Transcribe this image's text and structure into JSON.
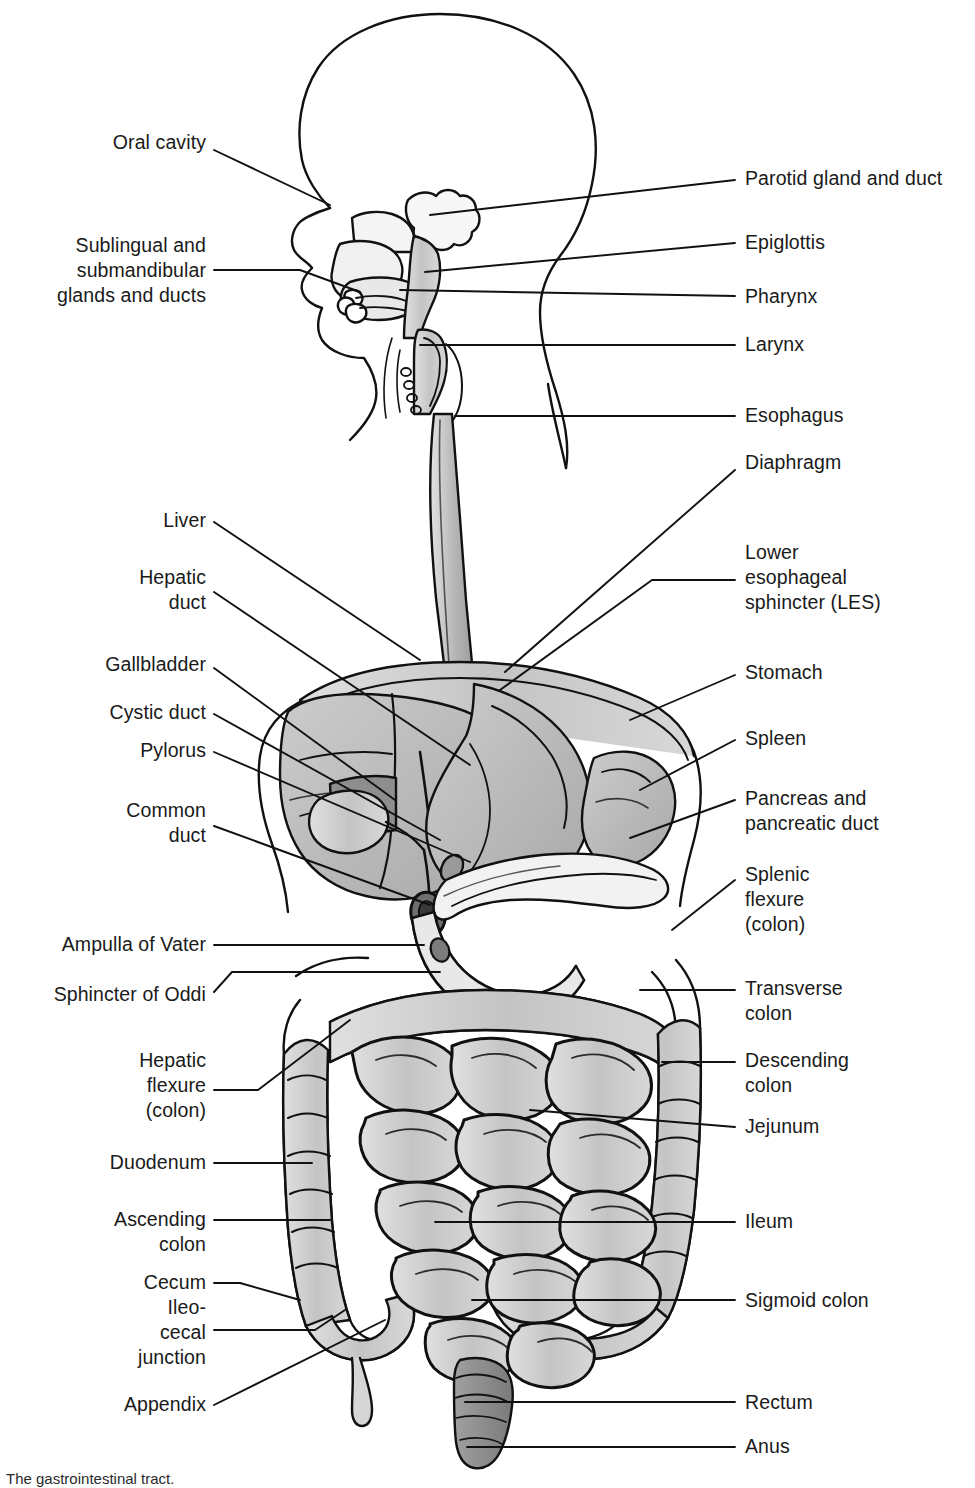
{
  "figure": {
    "title": "The gastrointestinal tract",
    "caption": "The gastrointestinal tract.",
    "type": "anatomical-diagram",
    "view": "sagittal / anterior composite",
    "colors": {
      "ink": "#1a1a1a",
      "background": "#ffffff",
      "fill_light": "#d0d0d0",
      "fill_mid": "#b4b4b4",
      "fill_dark": "#8e8e8e",
      "fill_deep": "#6f6f6f"
    }
  },
  "labels_left": [
    {
      "id": "oral-cavity",
      "text": "Oral cavity",
      "x": 8,
      "y": 130,
      "w": 198,
      "line": [
        [
          214,
          150
        ],
        [
          330,
          205
        ]
      ]
    },
    {
      "id": "sublingual",
      "text": "Sublingual and\nsubmandibular\nglands and ducts",
      "x": 8,
      "y": 233,
      "w": 198,
      "line": [
        [
          214,
          270
        ],
        [
          300,
          270
        ],
        [
          360,
          292
        ]
      ]
    },
    {
      "id": "liver",
      "text": "Liver",
      "x": 8,
      "y": 508,
      "w": 198,
      "line": [
        [
          214,
          522
        ],
        [
          420,
          660
        ]
      ]
    },
    {
      "id": "hepatic-duct",
      "text": "Hepatic\nduct",
      "x": 8,
      "y": 565,
      "w": 198,
      "line": [
        [
          214,
          592
        ],
        [
          470,
          765
        ]
      ]
    },
    {
      "id": "gallbladder",
      "text": "Gallbladder",
      "x": 8,
      "y": 652,
      "w": 198,
      "line": [
        [
          214,
          668
        ],
        [
          395,
          800
        ]
      ]
    },
    {
      "id": "cystic-duct",
      "text": "Cystic duct",
      "x": 8,
      "y": 700,
      "w": 198,
      "line": [
        [
          214,
          714
        ],
        [
          440,
          840
        ]
      ]
    },
    {
      "id": "pylorus",
      "text": "Pylorus",
      "x": 8,
      "y": 738,
      "w": 198,
      "line": [
        [
          214,
          752
        ],
        [
          470,
          862
        ]
      ]
    },
    {
      "id": "common-duct",
      "text": "Common\nduct",
      "x": 8,
      "y": 798,
      "w": 198,
      "line": [
        [
          214,
          826
        ],
        [
          430,
          905
        ]
      ]
    },
    {
      "id": "ampulla-of-vater",
      "text": "Ampulla of Vater",
      "x": 8,
      "y": 932,
      "w": 198,
      "line": [
        [
          214,
          945
        ],
        [
          424,
          945
        ]
      ]
    },
    {
      "id": "sphincter-of-oddi",
      "text": "Sphincter of Oddi",
      "x": 8,
      "y": 982,
      "w": 198,
      "line": [
        [
          214,
          992
        ],
        [
          232,
          972
        ],
        [
          440,
          972
        ]
      ]
    },
    {
      "id": "hepatic-flexure",
      "text": "Hepatic\nflexure\n(colon)",
      "x": 8,
      "y": 1048,
      "w": 198,
      "line": [
        [
          214,
          1090
        ],
        [
          258,
          1090
        ],
        [
          350,
          1020
        ]
      ]
    },
    {
      "id": "duodenum",
      "text": "Duodenum",
      "x": 8,
      "y": 1150,
      "w": 198,
      "line": [
        [
          214,
          1163
        ],
        [
          312,
          1163
        ]
      ]
    },
    {
      "id": "ascending-colon",
      "text": "Ascending\ncolon",
      "x": 8,
      "y": 1207,
      "w": 198,
      "line": [
        [
          214,
          1220
        ],
        [
          330,
          1220
        ]
      ]
    },
    {
      "id": "cecum-ileocecal",
      "text": "Cecum\nIleo-\ncecal\njunction",
      "x": 8,
      "y": 1270,
      "w": 198,
      "line": [
        [
          214,
          1283
        ],
        [
          240,
          1283
        ],
        [
          300,
          1300
        ]
      ]
    },
    {
      "id": "cecum-ileocecal-2",
      "text": "",
      "x": 8,
      "y": 1330,
      "w": 198,
      "line": [
        [
          214,
          1330
        ],
        [
          315,
          1330
        ],
        [
          345,
          1310
        ]
      ]
    },
    {
      "id": "appendix",
      "text": "Appendix",
      "x": 8,
      "y": 1392,
      "w": 198,
      "line": [
        [
          214,
          1405
        ],
        [
          385,
          1320
        ]
      ]
    }
  ],
  "labels_right": [
    {
      "id": "parotid-gland",
      "text": "Parotid gland and duct",
      "x": 745,
      "y": 166,
      "line": [
        [
          735,
          180
        ],
        [
          430,
          215
        ]
      ]
    },
    {
      "id": "epiglottis",
      "text": "Epiglottis",
      "x": 745,
      "y": 230,
      "line": [
        [
          735,
          243
        ],
        [
          425,
          272
        ]
      ]
    },
    {
      "id": "pharynx",
      "text": "Pharynx",
      "x": 745,
      "y": 284,
      "line": [
        [
          735,
          296
        ],
        [
          400,
          290
        ]
      ]
    },
    {
      "id": "larynx",
      "text": "Larynx",
      "x": 745,
      "y": 332,
      "line": [
        [
          735,
          345
        ],
        [
          420,
          345
        ]
      ]
    },
    {
      "id": "esophagus",
      "text": "Esophagus",
      "x": 745,
      "y": 403,
      "line": [
        [
          735,
          416
        ],
        [
          455,
          416
        ]
      ]
    },
    {
      "id": "diaphragm",
      "text": "Diaphragm",
      "x": 745,
      "y": 450,
      "line": [
        [
          735,
          470
        ],
        [
          505,
          672
        ]
      ]
    },
    {
      "id": "lower-esophageal",
      "text": "Lower\nesophageal\nsphincter (LES)",
      "x": 745,
      "y": 540,
      "line": [
        [
          735,
          580
        ],
        [
          652,
          580
        ],
        [
          500,
          690
        ]
      ]
    },
    {
      "id": "stomach",
      "text": "Stomach",
      "x": 745,
      "y": 660,
      "line": [
        [
          735,
          675
        ],
        [
          630,
          720
        ]
      ]
    },
    {
      "id": "spleen",
      "text": "Spleen",
      "x": 745,
      "y": 726,
      "line": [
        [
          735,
          740
        ],
        [
          640,
          790
        ]
      ]
    },
    {
      "id": "pancreas",
      "text": "Pancreas and\npancreatic duct",
      "x": 745,
      "y": 786,
      "line": [
        [
          735,
          800
        ],
        [
          630,
          838
        ]
      ]
    },
    {
      "id": "splenic-flexure",
      "text": "Splenic\nflexure\n(colon)",
      "x": 745,
      "y": 862,
      "line": [
        [
          735,
          880
        ],
        [
          672,
          930
        ]
      ]
    },
    {
      "id": "transverse-colon",
      "text": "Transverse\ncolon",
      "x": 745,
      "y": 976,
      "line": [
        [
          735,
          990
        ],
        [
          640,
          990
        ]
      ]
    },
    {
      "id": "descending-colon",
      "text": "Descending\ncolon",
      "x": 745,
      "y": 1048,
      "line": [
        [
          735,
          1062
        ],
        [
          662,
          1062
        ]
      ]
    },
    {
      "id": "jejunum",
      "text": "Jejunum",
      "x": 745,
      "y": 1114,
      "line": [
        [
          735,
          1127
        ],
        [
          530,
          1110
        ]
      ]
    },
    {
      "id": "ileum",
      "text": "Ileum",
      "x": 745,
      "y": 1209,
      "line": [
        [
          735,
          1222
        ],
        [
          435,
          1222
        ]
      ]
    },
    {
      "id": "sigmoid-colon",
      "text": "Sigmoid colon",
      "x": 745,
      "y": 1288,
      "line": [
        [
          735,
          1300
        ],
        [
          472,
          1300
        ]
      ]
    },
    {
      "id": "rectum",
      "text": "Rectum",
      "x": 745,
      "y": 1390,
      "line": [
        [
          735,
          1402
        ],
        [
          465,
          1402
        ]
      ]
    },
    {
      "id": "anus",
      "text": "Anus",
      "x": 745,
      "y": 1434,
      "line": [
        [
          735,
          1447
        ],
        [
          467,
          1447
        ]
      ]
    }
  ]
}
